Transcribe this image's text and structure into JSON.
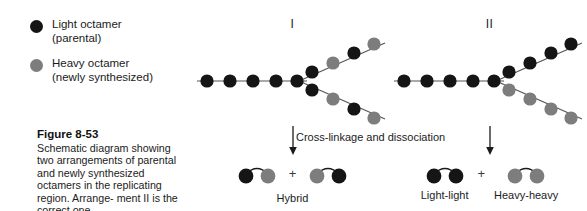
{
  "legend": {
    "items": [
      {
        "swatch": "dark-circle-icon",
        "color": "#151515",
        "label": "Light octamer",
        "sublabel": "(parental)"
      },
      {
        "swatch": "gray-circle-icon",
        "color": "#7d7d7d",
        "label": "Heavy octamer",
        "sublabel": "(newly synthesized)"
      }
    ]
  },
  "caption": {
    "title": "Figure 8-53",
    "line1": "Schematic diagram showing two",
    "line2": "arrangements of parental and",
    "line3": "newly synthesized octamers in",
    "line4": "the replicating region. Arrange-",
    "line5": "ment II is the correct one."
  },
  "colors": {
    "light": "#151515",
    "heavy": "#7d7d7d",
    "strand": "#555555",
    "text": "#1b1b1b"
  },
  "panels": [
    {
      "id": "I",
      "roman_label": "I",
      "arrow": "down-arrow-icon",
      "fork": {
        "stem_colors": [
          "light",
          "light",
          "light",
          "light",
          "light"
        ],
        "upper_branch_colors": [
          "light",
          "heavy",
          "light",
          "heavy"
        ],
        "lower_branch_colors": [
          "light",
          "heavy",
          "light",
          "heavy"
        ]
      },
      "products": [
        {
          "name": "hybrid-pair-left",
          "left_color": "light",
          "right_color": "heavy",
          "label": "Hybrid"
        },
        {
          "name": "hybrid-pair-right",
          "left_color": "heavy",
          "right_color": "light",
          "label": ""
        }
      ],
      "plus": "+"
    },
    {
      "id": "II",
      "roman_label": "II",
      "arrow": "down-arrow-icon",
      "fork": {
        "stem_colors": [
          "light",
          "light",
          "light",
          "light",
          "light"
        ],
        "upper_branch_colors": [
          "light",
          "light",
          "light",
          "light"
        ],
        "lower_branch_colors": [
          "heavy",
          "heavy",
          "heavy",
          "heavy"
        ]
      },
      "products": [
        {
          "name": "light-light-pair",
          "left_color": "light",
          "right_color": "light",
          "label": "Light-light"
        },
        {
          "name": "heavy-heavy-pair",
          "left_color": "heavy",
          "right_color": "heavy",
          "label": "Heavy-heavy"
        }
      ],
      "plus": "+"
    }
  ],
  "cross_note": "Cross-linkage and dissociation"
}
